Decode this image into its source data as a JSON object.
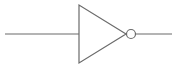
{
  "diagram": {
    "type": "logic-gate",
    "gate": "NOT",
    "stroke_color": "#6b6b6b",
    "background": "#ffffff",
    "input_line": {
      "x1": 5,
      "y1": 34,
      "x2": 79,
      "y2": 34
    },
    "triangle": {
      "points": "79,5 79,63 126,34"
    },
    "bubble": {
      "cx": 131,
      "cy": 34,
      "r": 4.5
    },
    "output_line": {
      "x1": 135.5,
      "y1": 34,
      "x2": 172,
      "y2": 34
    }
  }
}
